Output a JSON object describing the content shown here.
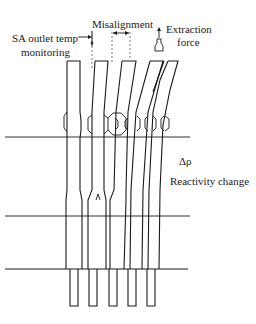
{
  "labels": {
    "sa_outlet_line1": "SA outlet temp",
    "sa_outlet_line2": "monitoring",
    "misalignment": "Misalignment",
    "extraction_line1": "Extraction",
    "extraction_line2": "force",
    "delta_rho": "Δρ",
    "reactivity": "Reactivity change"
  },
  "colors": {
    "stroke": "#1a1a1a",
    "background": "#ffffff"
  }
}
